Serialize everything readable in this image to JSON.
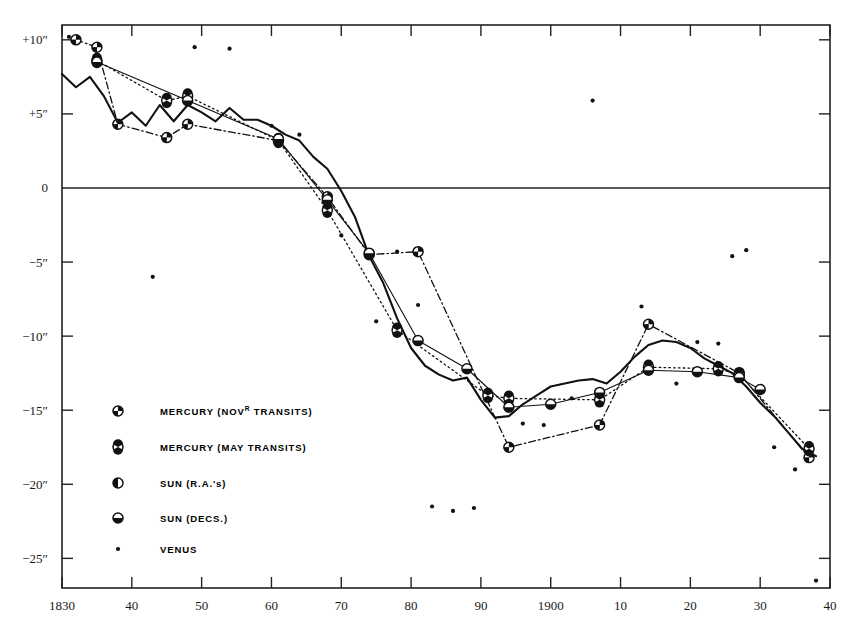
{
  "chart_data": {
    "type": "line",
    "title": "",
    "xlabel": "",
    "ylabel": "",
    "xlim": [
      1830,
      1940
    ],
    "ylim": [
      -27,
      11
    ],
    "grid": false,
    "legend_position": "inside-lower-left",
    "x_ticks": [
      1830,
      1840,
      1850,
      1860,
      1870,
      1880,
      1890,
      1900,
      1910,
      1920,
      1930,
      1940
    ],
    "x_tick_labels": [
      "1830",
      "40",
      "50",
      "60",
      "70",
      "80",
      "90",
      "1900",
      "10",
      "20",
      "30",
      "40"
    ],
    "y_ticks": [
      10,
      5,
      0,
      -5,
      -10,
      -15,
      -20,
      -25
    ],
    "y_tick_labels": [
      "+10″",
      "+5″",
      "0",
      "−5″",
      "−10″",
      "−15″",
      "−20″",
      "−25″"
    ],
    "zero_line": 0,
    "series": [
      {
        "name": "MERCURY (NOVᴿ TRANSITS)",
        "key": "mercury_nov",
        "marker": "quartered-circle",
        "linestyle": "dash-dot",
        "x": [
          1832,
          1835,
          1838,
          1845,
          1848,
          1861,
          1868,
          1874,
          1881,
          1894,
          1907,
          1914,
          1927,
          1937
        ],
        "y": [
          10.0,
          9.5,
          4.3,
          3.4,
          4.3,
          3.2,
          -0.6,
          -4.5,
          -4.3,
          -17.5,
          -16.0,
          -9.2,
          -12.5,
          -18.2
        ]
      },
      {
        "name": "MERCURY (MAY TRANSITS)",
        "key": "mercury_may",
        "marker": "bowtie-circle",
        "linestyle": "dotted",
        "x": [
          1835,
          1845,
          1848,
          1861,
          1868,
          1878,
          1891,
          1894,
          1907,
          1914,
          1924,
          1927,
          1937
        ],
        "y": [
          8.6,
          5.9,
          6.2,
          3.2,
          -1.5,
          -9.6,
          -14.0,
          -14.2,
          -14.3,
          -12.1,
          -12.2,
          -12.6,
          -17.6
        ]
      },
      {
        "name": "SUN (R.A.'s)",
        "key": "sun_ra",
        "marker": "half-left-circle",
        "linestyle": "solid-thick",
        "x": [
          1830,
          1832,
          1834,
          1836,
          1838,
          1840,
          1842,
          1844,
          1846,
          1848,
          1850,
          1852,
          1854,
          1856,
          1858,
          1860,
          1862,
          1864,
          1866,
          1868,
          1870,
          1872,
          1874,
          1876,
          1878,
          1880,
          1882,
          1884,
          1886,
          1888,
          1890,
          1892,
          1894,
          1896,
          1898,
          1900,
          1902,
          1904,
          1906,
          1908,
          1910,
          1912,
          1914,
          1916,
          1918,
          1920,
          1922,
          1924,
          1926,
          1928,
          1930,
          1932,
          1934,
          1936,
          1938
        ],
        "y": [
          7.7,
          6.8,
          7.5,
          6.2,
          4.4,
          5.1,
          4.2,
          5.6,
          4.5,
          5.6,
          5.1,
          4.5,
          5.4,
          4.6,
          4.6,
          4.2,
          3.6,
          3.2,
          2.1,
          1.3,
          -0.2,
          -2.0,
          -4.6,
          -6.4,
          -8.8,
          -10.8,
          -12.0,
          -12.6,
          -13.0,
          -12.8,
          -14.3,
          -15.5,
          -15.4,
          -14.6,
          -14.0,
          -13.4,
          -13.2,
          -13.0,
          -12.9,
          -13.2,
          -12.4,
          -11.4,
          -10.6,
          -10.3,
          -10.4,
          -10.8,
          -11.5,
          -12.0,
          -12.5,
          -13.4,
          -14.5,
          -15.4,
          -16.5,
          -17.6,
          -18.1
        ]
      },
      {
        "name": "SUN (DECS.)",
        "key": "sun_dec",
        "marker": "half-bottom-circle",
        "linestyle": "solid-thin",
        "x": [
          1835,
          1848,
          1861,
          1868,
          1874,
          1881,
          1888,
          1894,
          1900,
          1907,
          1914,
          1921,
          1927,
          1930
        ],
        "y": [
          8.5,
          5.9,
          3.3,
          -0.8,
          -4.4,
          -10.3,
          -12.2,
          -14.8,
          -14.6,
          -13.8,
          -12.3,
          -12.4,
          -12.8,
          -13.6
        ]
      },
      {
        "name": "VENUS",
        "key": "venus",
        "marker": "small-dot",
        "linestyle": "none",
        "x": [
          1831,
          1843,
          1849,
          1854,
          1860,
          1864,
          1870,
          1875,
          1878,
          1881,
          1883,
          1886,
          1889,
          1896,
          1899,
          1903,
          1906,
          1913,
          1918,
          1921,
          1924,
          1926,
          1928,
          1932,
          1935,
          1938
        ],
        "y": [
          10.2,
          -6.0,
          9.5,
          9.4,
          4.2,
          3.6,
          -3.2,
          -9.0,
          -4.3,
          -7.9,
          -21.5,
          -21.8,
          -21.6,
          -15.9,
          -16.0,
          -14.2,
          5.9,
          -8.0,
          -13.2,
          -10.4,
          -10.5,
          -4.6,
          -4.2,
          -17.5,
          -19.0,
          -26.5
        ]
      }
    ]
  },
  "legend": {
    "items": [
      {
        "label": "MERCURY (NOV",
        "sup": "R",
        "tail": " TRANSITS)",
        "marker": "quartered-circle"
      },
      {
        "label": "MERCURY (MAY TRANSITS)",
        "sup": "",
        "tail": "",
        "marker": "bowtie-circle"
      },
      {
        "label": "SUN (R.A.'s)",
        "sup": "",
        "tail": "",
        "marker": "half-left-circle"
      },
      {
        "label": "SUN (DECS.)",
        "sup": "",
        "tail": "",
        "marker": "half-bottom-circle"
      },
      {
        "label": "VENUS",
        "sup": "",
        "tail": "",
        "marker": "small-dot"
      }
    ]
  },
  "colors": {
    "ink": "#111111",
    "axis": "#222222",
    "background": "#ffffff"
  }
}
